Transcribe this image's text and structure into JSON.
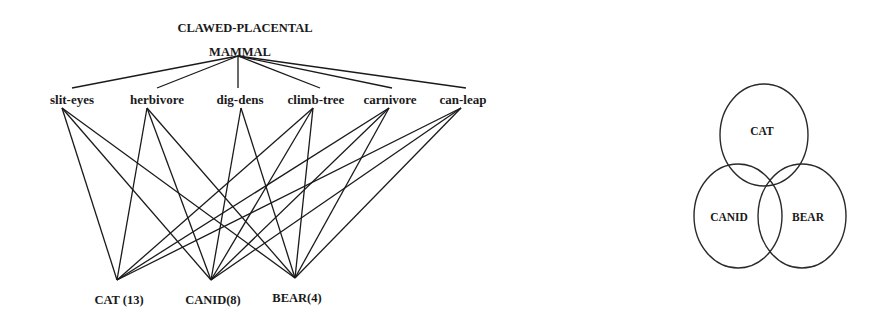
{
  "lattice": {
    "root": {
      "line1": "CLAWED-PLACENTAL",
      "line2": "MAMMAL",
      "x": 238,
      "y": 56
    },
    "attributes": [
      {
        "id": "slit-eyes",
        "label": "slit-eyes",
        "label_x": 72,
        "label_y": 104,
        "top_x": 72,
        "node_x": 62,
        "node_y": 108
      },
      {
        "id": "herbivore",
        "label": "herbivore",
        "label_x": 157,
        "label_y": 104,
        "top_x": 157,
        "node_x": 147,
        "node_y": 108
      },
      {
        "id": "dig-dens",
        "label": "dig-dens",
        "label_x": 240,
        "label_y": 104,
        "top_x": 238,
        "node_x": 241,
        "node_y": 108
      },
      {
        "id": "climb-tree",
        "label": "climb-tree",
        "label_x": 316,
        "label_y": 104,
        "top_x": 320,
        "node_x": 313,
        "node_y": 108
      },
      {
        "id": "carnivore",
        "label": "carnivore",
        "label_x": 390,
        "label_y": 104,
        "top_x": 392,
        "node_x": 389,
        "node_y": 108
      },
      {
        "id": "can-leap",
        "label": "can-leap",
        "label_x": 463,
        "label_y": 104,
        "top_x": 466,
        "node_x": 461,
        "node_y": 108
      }
    ],
    "classes": [
      {
        "id": "cat",
        "label": "CAT (13)",
        "x": 117,
        "y": 280,
        "label_y": 304
      },
      {
        "id": "canid",
        "label": "CANID(8)",
        "x": 211,
        "y": 280,
        "label_y": 304
      },
      {
        "id": "bear",
        "label": "BEAR(4)",
        "x": 295,
        "y": 278,
        "label_y": 302
      }
    ],
    "edges": [
      [
        "slit-eyes",
        "cat"
      ],
      [
        "slit-eyes",
        "canid"
      ],
      [
        "slit-eyes",
        "bear"
      ],
      [
        "herbivore",
        "cat"
      ],
      [
        "herbivore",
        "canid"
      ],
      [
        "herbivore",
        "bear"
      ],
      [
        "dig-dens",
        "canid"
      ],
      [
        "dig-dens",
        "bear"
      ],
      [
        "climb-tree",
        "cat"
      ],
      [
        "climb-tree",
        "canid"
      ],
      [
        "climb-tree",
        "bear"
      ],
      [
        "carnivore",
        "cat"
      ],
      [
        "carnivore",
        "canid"
      ],
      [
        "carnivore",
        "bear"
      ],
      [
        "can-leap",
        "cat"
      ],
      [
        "can-leap",
        "canid"
      ],
      [
        "can-leap",
        "bear"
      ]
    ]
  },
  "venn": {
    "sets": [
      {
        "id": "cat",
        "label": "CAT",
        "cx": 764,
        "cy": 135,
        "rx": 44,
        "ry": 51,
        "label_x": 762,
        "label_y": 135
      },
      {
        "id": "canid",
        "label": "CANID",
        "cx": 738,
        "cy": 216,
        "rx": 44,
        "ry": 52,
        "label_x": 729,
        "label_y": 221
      },
      {
        "id": "bear",
        "label": "BEAR",
        "cx": 802,
        "cy": 216,
        "rx": 44,
        "ry": 52,
        "label_x": 808,
        "label_y": 221
      }
    ]
  },
  "colors": {
    "ink": "#1a1a1a",
    "background": "#ffffff"
  }
}
